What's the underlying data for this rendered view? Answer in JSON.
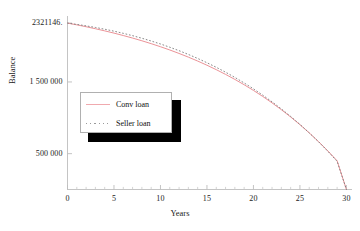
{
  "chart_data": {
    "type": "line",
    "title": "",
    "xlabel": "Years",
    "ylabel": "Balance",
    "xlim": [
      0,
      30.6
    ],
    "ylim": [
      0,
      2420000
    ],
    "grid": false,
    "legend_position": "middle-left",
    "x_ticks": [
      {
        "value": 0,
        "label": "0"
      },
      {
        "value": 5,
        "label": "5"
      },
      {
        "value": 10,
        "label": "10"
      },
      {
        "value": 15,
        "label": "15"
      },
      {
        "value": 20,
        "label": "20"
      },
      {
        "value": 25,
        "label": "25"
      },
      {
        "value": 30,
        "label": "30"
      }
    ],
    "x_minor_tick_step": 1,
    "y_ticks": [
      {
        "value": 2321146,
        "label": "2321146."
      },
      {
        "value": 1500000,
        "label": "1 500 000"
      },
      {
        "value": 500000,
        "label": "500 000"
      }
    ],
    "x": [
      0,
      1,
      2,
      3,
      4,
      5,
      6,
      7,
      8,
      9,
      10,
      11,
      12,
      13,
      14,
      15,
      16,
      17,
      18,
      19,
      20,
      21,
      22,
      23,
      24,
      25,
      26,
      27,
      28,
      29,
      30
    ],
    "series": [
      {
        "name": "Conv loan",
        "style": "solid",
        "color": "#e8868b",
        "values": [
          2321146,
          2296500,
          2270300,
          2242400,
          2212800,
          2181300,
          2147800,
          2112200,
          2074400,
          2034200,
          1991500,
          1946000,
          1897700,
          1846300,
          1791600,
          1733400,
          1671500,
          1605700,
          1535700,
          1461200,
          1382000,
          1297800,
          1208300,
          1113100,
          1011900,
          904200,
          789700,
          667900,
          538300,
          400400,
          0
        ]
      },
      {
        "name": "Seller loan",
        "style": "dotted",
        "color": "#7d7d7d",
        "values": [
          2321146,
          2303000,
          2282800,
          2260400,
          2235600,
          2208300,
          2178300,
          2145600,
          2110000,
          2071400,
          2029700,
          1984600,
          1936100,
          1884000,
          1828100,
          1768300,
          1704400,
          1636200,
          1563500,
          1486100,
          1403700,
          1316100,
          1223000,
          1124200,
          1019400,
          908300,
          790500,
          665700,
          533500,
          393500,
          0
        ]
      }
    ],
    "legend_entries": [
      "Conv loan",
      "Seller loan"
    ]
  },
  "axes": {
    "x_title": "Years",
    "y_title": "Balance"
  },
  "colors": {
    "conv_loan": "#e8868b",
    "seller_loan": "#7d7d7d",
    "axis": "#b4b4b4",
    "legend_shadow": "#000000",
    "legend_border": "#b0b0b0",
    "background": "#ffffff"
  }
}
